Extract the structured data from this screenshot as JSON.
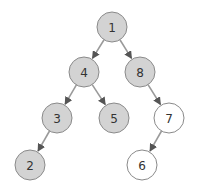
{
  "diagram": {
    "type": "binary-tree",
    "colors": {
      "highlighted_fill": "#d3d3d3",
      "normal_fill": "#ffffff",
      "border": "#8a8a8a",
      "edge": "#9a9a9a",
      "text": "#333333"
    },
    "nodes": [
      {
        "id": "1",
        "label": "1",
        "x": 112,
        "y": 27,
        "highlighted": true
      },
      {
        "id": "4",
        "label": "4",
        "x": 84,
        "y": 72,
        "highlighted": true
      },
      {
        "id": "8",
        "label": "8",
        "x": 140,
        "y": 72,
        "highlighted": true
      },
      {
        "id": "3",
        "label": "3",
        "x": 57,
        "y": 118,
        "highlighted": true
      },
      {
        "id": "5",
        "label": "5",
        "x": 114,
        "y": 118,
        "highlighted": true
      },
      {
        "id": "7",
        "label": "7",
        "x": 169,
        "y": 118,
        "highlighted": false
      },
      {
        "id": "2",
        "label": "2",
        "x": 30,
        "y": 165,
        "highlighted": true
      },
      {
        "id": "6",
        "label": "6",
        "x": 142,
        "y": 165,
        "highlighted": false
      }
    ],
    "edges": [
      {
        "from": "1",
        "to": "4"
      },
      {
        "from": "1",
        "to": "8"
      },
      {
        "from": "4",
        "to": "3"
      },
      {
        "from": "4",
        "to": "5"
      },
      {
        "from": "8",
        "to": "7"
      },
      {
        "from": "3",
        "to": "2"
      },
      {
        "from": "7",
        "to": "6"
      }
    ]
  }
}
